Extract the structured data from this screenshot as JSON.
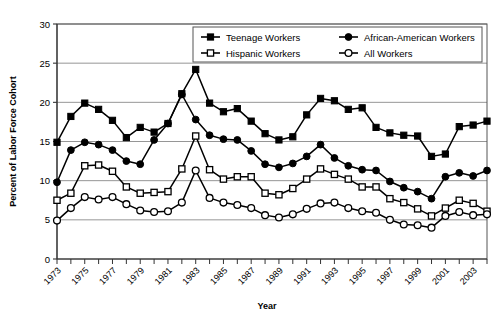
{
  "chart_data": {
    "type": "line",
    "title": "",
    "xlabel": "Year",
    "ylabel": "Percent of Labor Force Cohort",
    "xlim": [
      1973,
      2004
    ],
    "ylim": [
      0,
      30
    ],
    "ytick_step": 5,
    "yticks": [
      0,
      5,
      10,
      15,
      20,
      25,
      30
    ],
    "xticks_major": [
      1973,
      1975,
      1977,
      1979,
      1981,
      1983,
      1985,
      1987,
      1989,
      1991,
      1993,
      1995,
      1997,
      1999,
      2001,
      2003
    ],
    "xticks_all": [
      1973,
      1974,
      1975,
      1976,
      1977,
      1978,
      1979,
      1980,
      1981,
      1982,
      1983,
      1984,
      1985,
      1986,
      1987,
      1988,
      1989,
      1990,
      1991,
      1992,
      1993,
      1994,
      1995,
      1996,
      1997,
      1998,
      1999,
      2000,
      2001,
      2002,
      2003,
      2004
    ],
    "grid": "horizontal",
    "legend_position": "top-right-inside",
    "x": [
      1973,
      1974,
      1975,
      1976,
      1977,
      1978,
      1979,
      1980,
      1981,
      1982,
      1983,
      1984,
      1985,
      1986,
      1987,
      1988,
      1989,
      1990,
      1991,
      1992,
      1993,
      1994,
      1995,
      1996,
      1997,
      1998,
      1999,
      2000,
      2001,
      2002,
      2003,
      2004
    ],
    "series": [
      {
        "name": "Teenage Workers",
        "marker": "filled-square",
        "values": [
          14.9,
          18.2,
          19.9,
          19.1,
          17.7,
          15.5,
          16.8,
          16.2,
          17.3,
          21.1,
          24.2,
          19.9,
          18.8,
          19.2,
          17.6,
          16.0,
          15.2,
          15.6,
          18.4,
          20.5,
          20.2,
          19.1,
          19.3,
          16.8,
          16.1,
          15.8,
          15.7,
          13.1,
          13.4,
          16.9,
          17.1,
          17.6
        ]
      },
      {
        "name": "African-American Workers",
        "marker": "filled-circle",
        "values": [
          9.8,
          13.9,
          14.9,
          14.6,
          13.9,
          12.5,
          12.1,
          15.2,
          17.3,
          21.0,
          17.8,
          15.8,
          15.3,
          15.2,
          13.8,
          12.1,
          11.7,
          12.2,
          13.1,
          14.6,
          12.9,
          11.9,
          11.4,
          11.3,
          9.9,
          9.1,
          8.6,
          7.7,
          10.5,
          11.0,
          10.6,
          11.3
        ]
      },
      {
        "name": "Hispanic Workers",
        "marker": "open-square",
        "values": [
          7.5,
          8.4,
          11.9,
          12.0,
          11.2,
          9.2,
          8.4,
          8.5,
          8.6,
          11.5,
          15.7,
          11.4,
          10.2,
          10.5,
          10.5,
          8.4,
          8.2,
          9.0,
          10.2,
          11.5,
          10.8,
          10.2,
          9.2,
          9.2,
          7.7,
          7.2,
          6.4,
          5.5,
          6.5,
          7.5,
          7.1,
          6.1
        ]
      },
      {
        "name": "All Workers",
        "marker": "open-circle",
        "values": [
          4.9,
          6.5,
          7.9,
          7.6,
          7.9,
          7.0,
          6.2,
          6.0,
          6.1,
          7.2,
          11.3,
          7.8,
          7.2,
          6.9,
          6.5,
          5.6,
          5.3,
          5.7,
          6.4,
          7.1,
          7.2,
          6.5,
          6.1,
          5.9,
          5.0,
          4.4,
          4.3,
          4.0,
          5.5,
          6.0,
          5.6,
          5.7
        ]
      }
    ]
  },
  "legend": {
    "items": [
      {
        "label": "Teenage Workers",
        "marker": "filled-square"
      },
      {
        "label": "African-American Workers",
        "marker": "filled-circle"
      },
      {
        "label": "Hispanic Workers",
        "marker": "open-square"
      },
      {
        "label": "All Workers",
        "marker": "open-circle"
      }
    ]
  },
  "axes": {
    "ylabel": "Percent of Labor Force Cohort",
    "xlabel": "Year"
  }
}
